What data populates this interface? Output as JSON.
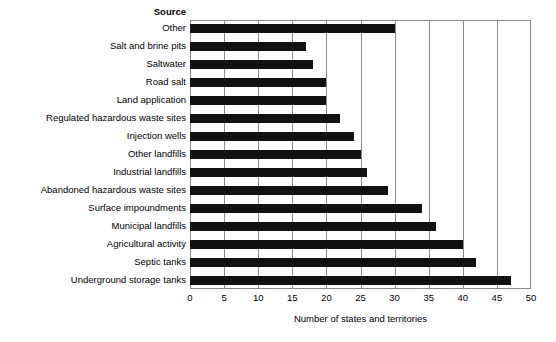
{
  "chart_data": {
    "type": "bar",
    "orientation": "horizontal",
    "title": "",
    "xlabel": "Number of states and territories",
    "ylabel": "Source",
    "categories": [
      "Other",
      "Salt and brine pits",
      "Saltwater",
      "Road salt",
      "Land application",
      "Regulated hazardous waste sites",
      "Injection wells",
      "Other landfills",
      "Industrial landfills",
      "Abandoned hazardous waste sites",
      "Surface impoundments",
      "Municipal landfills",
      "Agricultural activity",
      "Septic tanks",
      "Underground storage tanks"
    ],
    "values": [
      30,
      17,
      18,
      20,
      20,
      22,
      24,
      25,
      26,
      29,
      34,
      36,
      40,
      42,
      47
    ],
    "xlim": [
      0,
      50
    ],
    "xticks": [
      0,
      5,
      10,
      15,
      20,
      25,
      30,
      35,
      40,
      45,
      50
    ],
    "xtick_labels": [
      "0",
      "5",
      "10",
      "15",
      "20",
      "25",
      "30",
      "35",
      "40",
      "45",
      "50"
    ],
    "grid": "vertical",
    "legend": "none",
    "bar_color": "#111111",
    "grid_color": "#8a8a8a",
    "background_color": "#ffffff"
  },
  "legend_header": {
    "source_label": "Source"
  }
}
